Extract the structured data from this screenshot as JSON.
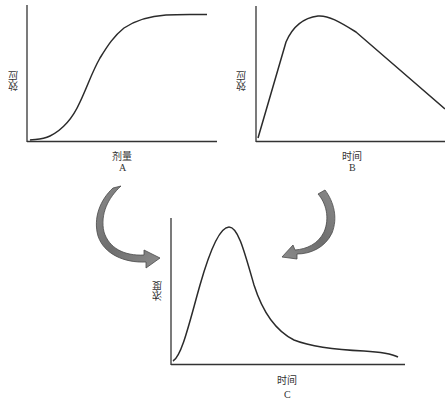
{
  "diagram": {
    "panels": [
      {
        "id": "A",
        "caption": "A",
        "xlabel": "剂量",
        "ylabel": "效应",
        "curve_description": "S-shaped dose-response curve rising from near zero and plateauing"
      },
      {
        "id": "B",
        "caption": "B",
        "xlabel": "时间",
        "ylabel": "效应",
        "curve_description": "Effect rises rapidly to a peak then declines linearly over time"
      },
      {
        "id": "C",
        "caption": "C",
        "xlabel": "时间",
        "ylabel": "浓度",
        "curve_description": "Concentration-time curve with sharp peak and long decaying tail"
      }
    ],
    "arrows": [
      {
        "from": "A",
        "to": "C",
        "direction": "curved-clockwise",
        "color": "#7a7a7a"
      },
      {
        "from": "B",
        "to": "C",
        "direction": "curved-counterclockwise",
        "color": "#7a7a7a"
      }
    ],
    "colors": {
      "axis": "#333333",
      "curve": "#2b2b2b",
      "arrow_fill": "#7a7a7a",
      "arrow_edge": "#4a4a4a",
      "background": "#ffffff"
    }
  }
}
